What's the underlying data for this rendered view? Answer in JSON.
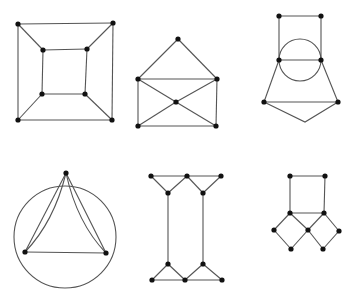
{
  "canvas": {
    "width": 353,
    "height": 297,
    "background": "#ffffff",
    "edge_color": "#555555",
    "vertex_color": "#111111",
    "vertex_radius": 2.6
  },
  "graphs": [
    {
      "name": "cube-graph",
      "vertices": [
        [
          18,
          24
        ],
        [
          113,
          23
        ],
        [
          18,
          120
        ],
        [
          112,
          120
        ],
        [
          43,
          50
        ],
        [
          87,
          49
        ],
        [
          42,
          94
        ],
        [
          85,
          94
        ]
      ],
      "edges": [
        [
          0,
          1
        ],
        [
          1,
          3
        ],
        [
          3,
          2
        ],
        [
          2,
          0
        ],
        [
          4,
          5
        ],
        [
          5,
          7
        ],
        [
          7,
          6
        ],
        [
          6,
          4
        ],
        [
          0,
          4
        ],
        [
          1,
          5
        ],
        [
          2,
          6
        ],
        [
          3,
          7
        ]
      ],
      "curves": [],
      "circles": [],
      "undotted": []
    },
    {
      "name": "envelope-graph",
      "vertices": [
        [
          178,
          39
        ],
        [
          138,
          79
        ],
        [
          217,
          79
        ],
        [
          176,
          102
        ],
        [
          138,
          126
        ],
        [
          216,
          126
        ]
      ],
      "edges": [
        [
          0,
          1
        ],
        [
          0,
          2
        ],
        [
          1,
          2
        ],
        [
          1,
          4
        ],
        [
          2,
          5
        ],
        [
          4,
          5
        ],
        [
          1,
          3
        ],
        [
          3,
          5
        ],
        [
          2,
          3
        ],
        [
          3,
          4
        ]
      ],
      "curves": [],
      "circles": [],
      "undotted": []
    },
    {
      "name": "circle-house-graph",
      "vertices": [
        [
          279,
          16
        ],
        [
          321,
          16
        ],
        [
          279,
          60
        ],
        [
          321,
          60
        ],
        [
          264,
          102
        ],
        [
          338,
          102
        ]
      ],
      "edges": [
        [
          0,
          1
        ],
        [
          0,
          2
        ],
        [
          1,
          3
        ],
        [
          2,
          3
        ],
        [
          2,
          4
        ],
        [
          3,
          5
        ],
        [
          4,
          5
        ]
      ],
      "curves": [],
      "circles": [
        [
          300,
          60,
          21
        ]
      ],
      "undotted": [
        [
          [
            264,
            102
          ],
          [
            305,
            122
          ],
          [
            338,
            102
          ]
        ]
      ]
    },
    {
      "name": "circle-triangle-multigraph",
      "vertices": [
        [
          66,
          173
        ],
        [
          25,
          252
        ],
        [
          106,
          253
        ]
      ],
      "edges": [
        [
          0,
          1
        ],
        [
          0,
          2
        ],
        [
          1,
          2
        ]
      ],
      "curves": [
        "M66,173 Q54,222 25,252",
        "M66,173 Q77,223 106,253"
      ],
      "circles": [
        [
          65,
          237,
          51
        ]
      ],
      "undotted": []
    },
    {
      "name": "i-beam-graph",
      "vertices": [
        [
          151,
          176
        ],
        [
          187,
          176
        ],
        [
          221,
          176
        ],
        [
          168,
          193
        ],
        [
          203,
          193
        ],
        [
          168,
          264
        ],
        [
          203,
          264
        ],
        [
          152,
          280
        ],
        [
          185,
          280
        ],
        [
          222,
          280
        ]
      ],
      "edges": [
        [
          0,
          1
        ],
        [
          1,
          2
        ],
        [
          0,
          3
        ],
        [
          1,
          3
        ],
        [
          1,
          4
        ],
        [
          2,
          4
        ],
        [
          3,
          5
        ],
        [
          4,
          6
        ],
        [
          5,
          7
        ],
        [
          5,
          8
        ],
        [
          6,
          8
        ],
        [
          6,
          9
        ],
        [
          7,
          8
        ],
        [
          8,
          9
        ]
      ],
      "curves": [],
      "circles": [],
      "undotted": []
    },
    {
      "name": "square-diamonds-graph",
      "vertices": [
        [
          290,
          176
        ],
        [
          325,
          176
        ],
        [
          290,
          213
        ],
        [
          324,
          213
        ],
        [
          308,
          230
        ],
        [
          274,
          230
        ],
        [
          339,
          231
        ],
        [
          291,
          249
        ],
        [
          323,
          249
        ]
      ],
      "edges": [
        [
          0,
          1
        ],
        [
          0,
          2
        ],
        [
          1,
          3
        ],
        [
          2,
          3
        ],
        [
          2,
          5
        ],
        [
          5,
          7
        ],
        [
          7,
          4
        ],
        [
          4,
          2
        ],
        [
          3,
          4
        ],
        [
          4,
          8
        ],
        [
          8,
          6
        ],
        [
          6,
          3
        ]
      ],
      "curves": [],
      "circles": [],
      "undotted": []
    }
  ]
}
